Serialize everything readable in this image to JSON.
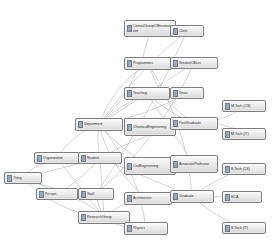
{
  "diagram": {
    "type": "class-hierarchy-graph",
    "background_color": "#ffffff",
    "node_fill_color": "#e2e2e2",
    "node_border_color": "#7d7d7d",
    "edge_color": "#9c9c9c",
    "label_color": "#2b2b2b",
    "node_icon": "owl-class-icon",
    "nodes": [
      {
        "id": "thing",
        "label": "Thing",
        "x": 4,
        "y": 172,
        "w": 38,
        "h": 12,
        "lines": 1
      },
      {
        "id": "organization",
        "label": "Organization",
        "x": 34,
        "y": 152,
        "w": 46,
        "h": 12,
        "lines": 1
      },
      {
        "id": "person",
        "label": "Person",
        "x": 36,
        "y": 188,
        "w": 42,
        "h": 12,
        "lines": 1
      },
      {
        "id": "student",
        "label": "Student",
        "x": 78,
        "y": 152,
        "w": 44,
        "h": 12,
        "lines": 1
      },
      {
        "id": "staff",
        "label": "Staff",
        "x": 78,
        "y": 188,
        "w": 36,
        "h": 12,
        "lines": 1
      },
      {
        "id": "research-group",
        "label": "ResearchGroup",
        "x": 78,
        "y": 211,
        "w": 52,
        "h": 13,
        "lines": 1
      },
      {
        "id": "department",
        "label": "Department",
        "x": 75,
        "y": 118,
        "w": 48,
        "h": 13,
        "lines": 1
      },
      {
        "id": "central-group",
        "label": "CentralGroup\nOfEnvironment",
        "x": 124,
        "y": 20,
        "w": 52,
        "h": 17,
        "lines": 2
      },
      {
        "id": "programmes",
        "label": "Programmes",
        "x": 124,
        "y": 57,
        "w": 48,
        "h": 13,
        "lines": 1
      },
      {
        "id": "teaching",
        "label": "Teaching",
        "x": 124,
        "y": 87,
        "w": 46,
        "h": 13,
        "lines": 1
      },
      {
        "id": "chemical-eng",
        "label": "ChemicalEngineer\ning",
        "x": 124,
        "y": 118,
        "w": 52,
        "h": 18,
        "lines": 2
      },
      {
        "id": "civil-eng",
        "label": "CivilEngineerin\ng",
        "x": 124,
        "y": 157,
        "w": 52,
        "h": 18,
        "lines": 2
      },
      {
        "id": "architecture",
        "label": "Architecture",
        "x": 124,
        "y": 192,
        "w": 48,
        "h": 13,
        "lines": 1
      },
      {
        "id": "physics",
        "label": "Physics",
        "x": 124,
        "y": 222,
        "w": 44,
        "h": 13,
        "lines": 1
      },
      {
        "id": "clerk",
        "label": "Clerk",
        "x": 170,
        "y": 25,
        "w": 34,
        "h": 12,
        "lines": 1
      },
      {
        "id": "section-officer",
        "label": "SectionOfficer",
        "x": 170,
        "y": 57,
        "w": 48,
        "h": 12,
        "lines": 1
      },
      {
        "id": "dean",
        "label": "Dean",
        "x": 170,
        "y": 87,
        "w": 34,
        "h": 12,
        "lines": 1
      },
      {
        "id": "post-graduate",
        "label": "PostGraduate",
        "x": 170,
        "y": 117,
        "w": 48,
        "h": 13,
        "lines": 1
      },
      {
        "id": "associate-prof",
        "label": "AssociateProfes\nsor",
        "x": 170,
        "y": 155,
        "w": 48,
        "h": 18,
        "lines": 2
      },
      {
        "id": "graduate",
        "label": "Graduate",
        "x": 170,
        "y": 190,
        "w": 44,
        "h": 13,
        "lines": 1
      },
      {
        "id": "mtech-cs",
        "label": "M.Tech (CS)",
        "x": 222,
        "y": 100,
        "w": 44,
        "h": 12,
        "lines": 1
      },
      {
        "id": "mtech-it",
        "label": "M.Tech (IT)",
        "x": 222,
        "y": 128,
        "w": 44,
        "h": 12,
        "lines": 1
      },
      {
        "id": "btech-cs",
        "label": "B.Tech (CS)",
        "x": 222,
        "y": 163,
        "w": 44,
        "h": 12,
        "lines": 1
      },
      {
        "id": "bca",
        "label": "BCA",
        "x": 222,
        "y": 191,
        "w": 40,
        "h": 12,
        "lines": 1
      },
      {
        "id": "btech-it",
        "label": "B.Tech (IT)",
        "x": 222,
        "y": 222,
        "w": 44,
        "h": 12,
        "lines": 1
      }
    ],
    "edges": [
      {
        "from": "thing",
        "to": "organization"
      },
      {
        "from": "thing",
        "to": "person"
      },
      {
        "from": "thing",
        "to": "student"
      },
      {
        "from": "thing",
        "to": "staff"
      },
      {
        "from": "thing",
        "to": "research-group"
      },
      {
        "from": "organization",
        "to": "department"
      },
      {
        "from": "organization",
        "to": "student"
      },
      {
        "from": "organization",
        "to": "research-group"
      },
      {
        "from": "person",
        "to": "student"
      },
      {
        "from": "person",
        "to": "staff"
      },
      {
        "from": "person",
        "to": "research-group"
      },
      {
        "from": "student",
        "to": "department"
      },
      {
        "from": "student",
        "to": "research-group"
      },
      {
        "from": "staff",
        "to": "research-group"
      },
      {
        "from": "department",
        "to": "central-group"
      },
      {
        "from": "department",
        "to": "programmes"
      },
      {
        "from": "department",
        "to": "teaching"
      },
      {
        "from": "department",
        "to": "chemical-eng"
      },
      {
        "from": "department",
        "to": "civil-eng"
      },
      {
        "from": "department",
        "to": "architecture"
      },
      {
        "from": "department",
        "to": "physics"
      },
      {
        "from": "department",
        "to": "clerk"
      },
      {
        "from": "department",
        "to": "section-officer"
      },
      {
        "from": "department",
        "to": "dean"
      },
      {
        "from": "programmes",
        "to": "post-graduate"
      },
      {
        "from": "programmes",
        "to": "graduate"
      },
      {
        "from": "teaching",
        "to": "dean"
      },
      {
        "from": "teaching",
        "to": "associate-prof"
      },
      {
        "from": "teaching",
        "to": "post-graduate"
      },
      {
        "from": "post-graduate",
        "to": "mtech-cs"
      },
      {
        "from": "post-graduate",
        "to": "mtech-it"
      },
      {
        "from": "graduate",
        "to": "btech-cs"
      },
      {
        "from": "graduate",
        "to": "bca"
      },
      {
        "from": "graduate",
        "to": "btech-it"
      },
      {
        "from": "research-group",
        "to": "physics"
      },
      {
        "from": "research-group",
        "to": "architecture"
      },
      {
        "from": "student",
        "to": "post-graduate"
      },
      {
        "from": "student",
        "to": "graduate"
      },
      {
        "from": "staff",
        "to": "clerk"
      },
      {
        "from": "staff",
        "to": "section-officer"
      }
    ]
  }
}
